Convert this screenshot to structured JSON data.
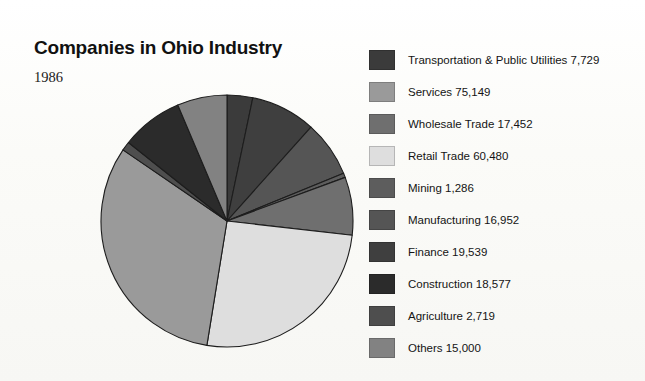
{
  "header": {
    "title": "Companies in Ohio Industry",
    "subtitle": "1986"
  },
  "chart_data": {
    "type": "pie",
    "title": "Companies in Ohio Industry",
    "subtitle": "1986",
    "xlabel": "",
    "ylabel": "",
    "legend_position": "right",
    "grid": false,
    "start_angle_deg": 0,
    "direction": "clockwise",
    "total": 234883,
    "categories": [
      "Transportation & Public Utilities",
      "Services",
      "Wholesale Trade",
      "Retail Trade",
      "Mining",
      "Manufacturing",
      "Finance",
      "Construction",
      "Agriculture",
      "Others"
    ],
    "values": [
      7729,
      75149,
      17452,
      60480,
      1286,
      16952,
      19539,
      18577,
      2719,
      15000
    ],
    "value_labels": [
      "7,729",
      "75,149",
      "17,452",
      "60,480",
      "1,286",
      "16,952",
      "19,539",
      "18,577",
      "2,719",
      "15,000"
    ],
    "colors": [
      "#3b3b3b",
      "#9a9a9a",
      "#6f6f6f",
      "#dedede",
      "#5d5d5d",
      "#555555",
      "#3f3f3f",
      "#2b2b2b",
      "#4e4e4e",
      "#828282"
    ],
    "slice_order": [
      "Transportation & Public Utilities",
      "Finance",
      "Manufacturing",
      "Mining",
      "Retail Trade",
      "Wholesale Trade",
      "Services",
      "Agriculture",
      "Construction",
      "Others"
    ]
  },
  "legend": {
    "items": [
      {
        "label": "Transportation & Public Utilities 7,729",
        "color": "#3b3b3b",
        "name": "transportation-public-utilities"
      },
      {
        "label": "Services 75,149",
        "color": "#9a9a9a",
        "name": "services"
      },
      {
        "label": "Wholesale Trade 17,452",
        "color": "#6f6f6f",
        "name": "wholesale-trade"
      },
      {
        "label": "Retail Trade 60,480",
        "color": "#dedede",
        "name": "retail-trade"
      },
      {
        "label": "Mining 1,286",
        "color": "#5d5d5d",
        "name": "mining"
      },
      {
        "label": "Manufacturing 16,952",
        "color": "#555555",
        "name": "manufacturing"
      },
      {
        "label": "Finance 19,539",
        "color": "#3f3f3f",
        "name": "finance"
      },
      {
        "label": "Construction 18,577",
        "color": "#2b2b2b",
        "name": "construction"
      },
      {
        "label": "Agriculture 2,719",
        "color": "#4e4e4e",
        "name": "agriculture"
      },
      {
        "label": "Others 15,000",
        "color": "#828282",
        "name": "others"
      }
    ]
  },
  "pie_render": {
    "cx": 129,
    "cy": 129,
    "r": 126,
    "stroke": "#1d1d1d",
    "stroke_width": 1.1,
    "slices": [
      {
        "name": "transportation-public-utilities",
        "value": 7729,
        "color": "#3b3b3b"
      },
      {
        "name": "finance",
        "value": 19539,
        "color": "#3f3f3f"
      },
      {
        "name": "manufacturing",
        "value": 16952,
        "color": "#555555"
      },
      {
        "name": "mining",
        "value": 1286,
        "color": "#5d5d5d"
      },
      {
        "name": "wholesale-trade",
        "value": 17452,
        "color": "#6f6f6f"
      },
      {
        "name": "retail-trade",
        "value": 60480,
        "color": "#dedede"
      },
      {
        "name": "services",
        "value": 75149,
        "color": "#9a9a9a"
      },
      {
        "name": "agriculture",
        "value": 2719,
        "color": "#4e4e4e"
      },
      {
        "name": "construction",
        "value": 18577,
        "color": "#2b2b2b"
      },
      {
        "name": "others",
        "value": 15000,
        "color": "#828282"
      }
    ]
  }
}
